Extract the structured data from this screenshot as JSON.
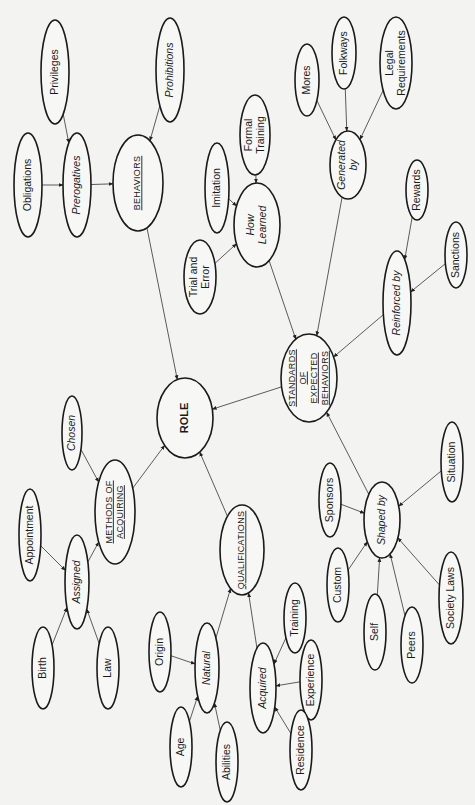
{
  "diagram": {
    "orientation": "rotated 90° counter-clockwise",
    "nodes": {
      "role": {
        "label": "ROLE",
        "lines": [
          "ROLE"
        ],
        "x": 185,
        "y": 418,
        "rx": 28,
        "ry": 40,
        "style": "bold"
      },
      "behaviors": {
        "label": "Behaviors",
        "lines": [
          "BEHAVIORS"
        ],
        "x": 138,
        "y": 183,
        "rx": 25,
        "ry": 48,
        "style": "smallcaps"
      },
      "prerogatives": {
        "label": "Prerogatives",
        "lines": [
          "Prerogatives"
        ],
        "x": 77,
        "y": 185,
        "rx": 14,
        "ry": 52,
        "style": "italic"
      },
      "obligations": {
        "label": "Obligations",
        "lines": [
          "Obligations"
        ],
        "x": 28,
        "y": 185,
        "rx": 14,
        "ry": 52,
        "style": "plain"
      },
      "privileges": {
        "label": "Privileges",
        "lines": [
          "Privileges"
        ],
        "x": 55,
        "y": 72,
        "rx": 14,
        "ry": 52,
        "style": "plain"
      },
      "prohibitions": {
        "label": "Prohibitions",
        "lines": [
          "Prohibitions"
        ],
        "x": 170,
        "y": 70,
        "rx": 14,
        "ry": 52,
        "style": "italic"
      },
      "imitation": {
        "label": "Imitation",
        "lines": [
          "Imitation"
        ],
        "x": 217,
        "y": 188,
        "rx": 12,
        "ry": 45,
        "style": "plain"
      },
      "formal_training": {
        "label": "Formal Training",
        "lines": [
          "Formal",
          "Training"
        ],
        "x": 255,
        "y": 135,
        "rx": 15,
        "ry": 40,
        "style": "plain"
      },
      "how_learned": {
        "label": "How Learned",
        "lines": [
          "How",
          "Learned"
        ],
        "x": 257,
        "y": 225,
        "rx": 23,
        "ry": 42,
        "style": "italic"
      },
      "trial_and_error": {
        "label": "Trial and Error",
        "lines": [
          "Trial and",
          "Error"
        ],
        "x": 200,
        "y": 277,
        "rx": 16,
        "ry": 37,
        "style": "plain"
      },
      "mores": {
        "label": "Mores",
        "lines": [
          "Mores"
        ],
        "x": 307,
        "y": 80,
        "rx": 12,
        "ry": 36,
        "style": "plain"
      },
      "folkways": {
        "label": "Folkways",
        "lines": [
          "Folkways"
        ],
        "x": 344,
        "y": 53,
        "rx": 12,
        "ry": 36,
        "style": "plain"
      },
      "legal_requirements": {
        "label": "Legal Requirements",
        "lines": [
          "Legal",
          "Requirements"
        ],
        "x": 396,
        "y": 63,
        "rx": 16,
        "ry": 46,
        "style": "plain"
      },
      "generated_by": {
        "label": "Generated by",
        "lines": [
          "Generated",
          "by"
        ],
        "x": 348,
        "y": 165,
        "rx": 18,
        "ry": 34,
        "style": "italic"
      },
      "rewards": {
        "label": "Rewards",
        "lines": [
          "Rewards"
        ],
        "x": 417,
        "y": 190,
        "rx": 11,
        "ry": 30,
        "style": "plain"
      },
      "sanctions": {
        "label": "Sanctions",
        "lines": [
          "Sanctions"
        ],
        "x": 456,
        "y": 255,
        "rx": 11,
        "ry": 33,
        "style": "plain"
      },
      "reinforced_by": {
        "label": "Reinforced by",
        "lines": [
          "Reinforced by"
        ],
        "x": 397,
        "y": 303,
        "rx": 14,
        "ry": 52,
        "style": "italic"
      },
      "standards": {
        "label": "Standards of Expected Behaviors",
        "lines": [
          "STANDARDS",
          "OF",
          "EXPECTED",
          "BEHAVIORS"
        ],
        "x": 309,
        "y": 378,
        "rx": 28,
        "ry": 44,
        "style": "smallcaps"
      },
      "chosen": {
        "label": "Chosen",
        "lines": [
          "Chosen"
        ],
        "x": 72,
        "y": 433,
        "rx": 10,
        "ry": 37,
        "style": "italic"
      },
      "methods_of_acquiring": {
        "label": "Methods of Acquiring",
        "lines": [
          "METHODS OF",
          "ACQUIRING"
        ],
        "x": 115,
        "y": 512,
        "rx": 20,
        "ry": 52,
        "style": "smallcaps"
      },
      "appointment": {
        "label": "Appointment",
        "lines": [
          "Appointment"
        ],
        "x": 30,
        "y": 535,
        "rx": 11,
        "ry": 46,
        "style": "plain"
      },
      "assigned": {
        "label": "Assigned",
        "lines": [
          "Assigned"
        ],
        "x": 77,
        "y": 582,
        "rx": 12,
        "ry": 47,
        "style": "italic"
      },
      "birth": {
        "label": "Birth",
        "lines": [
          "Birth"
        ],
        "x": 43,
        "y": 668,
        "rx": 11,
        "ry": 41,
        "style": "plain"
      },
      "law": {
        "label": "Law",
        "lines": [
          "Law"
        ],
        "x": 108,
        "y": 668,
        "rx": 11,
        "ry": 41,
        "style": "plain"
      },
      "qualifications": {
        "label": "Qualifications",
        "lines": [
          "QUALIFICATIONS"
        ],
        "x": 242,
        "y": 550,
        "rx": 22,
        "ry": 45,
        "style": "smallcaps"
      },
      "origin": {
        "label": "Origin",
        "lines": [
          "Origin"
        ],
        "x": 160,
        "y": 652,
        "rx": 11,
        "ry": 40,
        "style": "plain"
      },
      "natural": {
        "label": "Natural",
        "lines": [
          "Natural"
        ],
        "x": 207,
        "y": 668,
        "rx": 12,
        "ry": 45,
        "style": "italic"
      },
      "age": {
        "label": "Age",
        "lines": [
          "Age"
        ],
        "x": 181,
        "y": 747,
        "rx": 11,
        "ry": 40,
        "style": "plain"
      },
      "abilities": {
        "label": "Abilities",
        "lines": [
          "Abilities"
        ],
        "x": 227,
        "y": 762,
        "rx": 11,
        "ry": 40,
        "style": "plain"
      },
      "acquired": {
        "label": "Acquired",
        "lines": [
          "Acquired"
        ],
        "x": 263,
        "y": 688,
        "rx": 13,
        "ry": 45,
        "style": "italic"
      },
      "training": {
        "label": "Training",
        "lines": [
          "Training"
        ],
        "x": 295,
        "y": 618,
        "rx": 11,
        "ry": 35,
        "style": "plain"
      },
      "experience": {
        "label": "Experience",
        "lines": [
          "Experience"
        ],
        "x": 311,
        "y": 680,
        "rx": 11,
        "ry": 40,
        "style": "plain"
      },
      "residence": {
        "label": "Residence",
        "lines": [
          "Residence"
        ],
        "x": 301,
        "y": 750,
        "rx": 11,
        "ry": 40,
        "style": "plain"
      },
      "shaped_by": {
        "label": "Shaped by",
        "lines": [
          "Shaped by"
        ],
        "x": 382,
        "y": 520,
        "rx": 18,
        "ry": 38,
        "style": "italic"
      },
      "sponsors": {
        "label": "Sponsors",
        "lines": [
          "Sponsors"
        ],
        "x": 330,
        "y": 500,
        "rx": 11,
        "ry": 37,
        "style": "plain"
      },
      "custom": {
        "label": "Custom",
        "lines": [
          "Custom"
        ],
        "x": 338,
        "y": 585,
        "rx": 11,
        "ry": 37,
        "style": "plain"
      },
      "self": {
        "label": "Self",
        "lines": [
          "Self"
        ],
        "x": 375,
        "y": 632,
        "rx": 11,
        "ry": 38,
        "style": "plain"
      },
      "peers": {
        "label": "Peers",
        "lines": [
          "Peers"
        ],
        "x": 412,
        "y": 645,
        "rx": 11,
        "ry": 38,
        "style": "plain"
      },
      "society_laws": {
        "label": "Society Laws",
        "lines": [
          "Society Laws"
        ],
        "x": 451,
        "y": 598,
        "rx": 12,
        "ry": 46,
        "style": "plain"
      },
      "situation": {
        "label": "Situation",
        "lines": [
          "Situation"
        ],
        "x": 452,
        "y": 462,
        "rx": 11,
        "ry": 40,
        "style": "plain"
      }
    },
    "edges": [
      [
        "privileges",
        "prerogatives"
      ],
      [
        "obligations",
        "prerogatives"
      ],
      [
        "prerogatives",
        "behaviors"
      ],
      [
        "prohibitions",
        "behaviors"
      ],
      [
        "behaviors",
        "role"
      ],
      [
        "imitation",
        "how_learned"
      ],
      [
        "formal_training",
        "how_learned"
      ],
      [
        "trial_and_error",
        "how_learned"
      ],
      [
        "how_learned",
        "standards"
      ],
      [
        "mores",
        "generated_by"
      ],
      [
        "folkways",
        "generated_by"
      ],
      [
        "legal_requirements",
        "generated_by"
      ],
      [
        "generated_by",
        "standards"
      ],
      [
        "rewards",
        "reinforced_by"
      ],
      [
        "sanctions",
        "reinforced_by"
      ],
      [
        "reinforced_by",
        "standards"
      ],
      [
        "standards",
        "role"
      ],
      [
        "chosen",
        "methods_of_acquiring"
      ],
      [
        "appointment",
        "assigned"
      ],
      [
        "birth",
        "assigned"
      ],
      [
        "law",
        "assigned"
      ],
      [
        "assigned",
        "methods_of_acquiring"
      ],
      [
        "methods_of_acquiring",
        "role"
      ],
      [
        "qualifications",
        "role"
      ],
      [
        "origin",
        "natural"
      ],
      [
        "age",
        "natural"
      ],
      [
        "abilities",
        "natural"
      ],
      [
        "natural",
        "qualifications"
      ],
      [
        "training",
        "acquired"
      ],
      [
        "experience",
        "acquired"
      ],
      [
        "residence",
        "acquired"
      ],
      [
        "acquired",
        "qualifications"
      ],
      [
        "sponsors",
        "shaped_by"
      ],
      [
        "custom",
        "shaped_by"
      ],
      [
        "self",
        "shaped_by"
      ],
      [
        "peers",
        "shaped_by"
      ],
      [
        "society_laws",
        "shaped_by"
      ],
      [
        "situation",
        "shaped_by"
      ],
      [
        "shaped_by",
        "standards"
      ]
    ]
  }
}
